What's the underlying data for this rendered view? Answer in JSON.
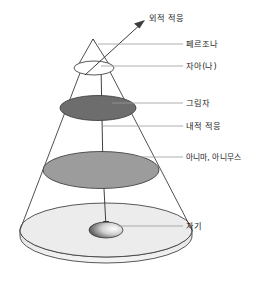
{
  "diagram": {
    "background_color": "#ffffff",
    "labels": {
      "external_adaptation": "외적 적응",
      "persona": "페르조나",
      "ego": "자아(나)",
      "shadow": "그림자",
      "internal_adaptation": "내적 적응",
      "anima_animus": "아니마, 아니무스",
      "self": "자기"
    },
    "layers": [
      {
        "key": "persona",
        "label": "페르조나",
        "fill": "#ffffff",
        "level": 1
      },
      {
        "key": "ego",
        "label": "자아(나)",
        "fill": "#ffffff",
        "level": 2
      },
      {
        "key": "shadow",
        "label": "그림자",
        "fill": "#6d6d6d",
        "level": 3
      },
      {
        "key": "anima_animus",
        "label": "아니마, 아니무스",
        "fill": "#9c9c9c",
        "level": 4
      },
      {
        "key": "self",
        "label": "자기",
        "fill": "#4a4a4a",
        "level": 5
      }
    ],
    "adaptations": [
      {
        "key": "external_adaptation",
        "label": "외적 적응",
        "direction": "outward"
      },
      {
        "key": "internal_adaptation",
        "label": "내적 적응",
        "direction": "inward"
      }
    ],
    "colors": {
      "cone_outline": "#3c3c3c",
      "leader_line": "#9a9a9a",
      "base_disk": "#e8e8e8",
      "shadow_disk": "#6d6d6d",
      "anima_disk": "#9c9c9c",
      "ego_disk": "#ffffff",
      "text": "#1b1b1b"
    }
  }
}
